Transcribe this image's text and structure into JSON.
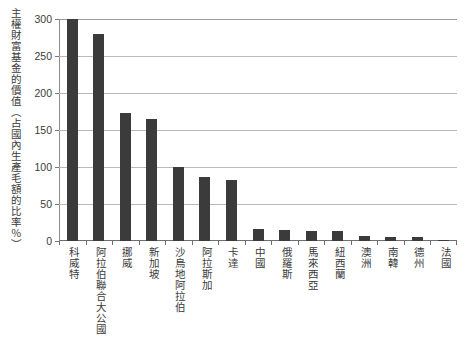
{
  "chart_data": {
    "type": "bar",
    "title": "",
    "subtitle": "",
    "xlabel": "",
    "ylabel": "主權財富基金的價值（占國內生產毛額的比率％）",
    "ylim": [
      0,
      300
    ],
    "ytick_labels": [
      "300",
      "250",
      "200",
      "150",
      "100",
      "50",
      "0"
    ],
    "ytick_values": [
      300,
      250,
      200,
      150,
      100,
      50,
      0
    ],
    "grid": true,
    "legend": "none",
    "bar_color": "#3b3b3b",
    "categories": [
      "科威特",
      "阿拉伯聯合大公國",
      "挪威",
      "新加坡",
      "沙烏地阿拉伯",
      "阿拉斯加",
      "卡達",
      "中國",
      "俄羅斯",
      "馬來西亞",
      "紐西蘭",
      "澳洲",
      "南韓",
      "德州",
      "法國"
    ],
    "values": [
      300,
      280,
      173,
      165,
      100,
      87,
      83,
      16,
      15,
      14,
      14,
      7,
      6,
      5,
      1
    ]
  },
  "colors": {
    "bar": "#3b3b3b",
    "grid": "#b9b9b9",
    "axis": "#6f6f6f",
    "text": "#3a3a3a",
    "background": "#ffffff"
  }
}
